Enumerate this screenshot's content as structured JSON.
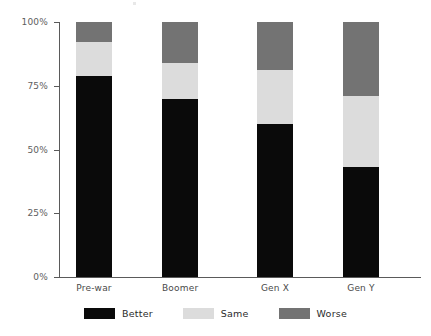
{
  "chart_data": {
    "type": "bar",
    "subtype": "stacked-percent",
    "title": "",
    "xlabel": "",
    "ylabel": "",
    "categories": [
      "Pre-war",
      "Boomer",
      "Gen X",
      "Gen Y"
    ],
    "series": [
      {
        "name": "Better",
        "color": "#0a0a0a",
        "values": [
          79,
          70,
          60,
          43
        ]
      },
      {
        "name": "Same",
        "color": "#dcdcdc",
        "values": [
          13,
          14,
          21,
          28
        ]
      },
      {
        "name": "Worse",
        "color": "#737373",
        "values": [
          8,
          16,
          19,
          29
        ]
      }
    ],
    "ylim": [
      0,
      100
    ],
    "yticks": [
      0,
      25,
      50,
      75,
      100
    ],
    "ytick_labels": [
      "0%",
      "25%",
      "50%",
      "75%",
      "100%"
    ],
    "grid": false,
    "legend_position": "bottom",
    "stack_order": [
      "Better",
      "Same",
      "Worse"
    ]
  },
  "axis": {
    "ticks": [
      {
        "label": "100%",
        "value": 100
      },
      {
        "label": "75%",
        "value": 75
      },
      {
        "label": "50%",
        "value": 50
      },
      {
        "label": "25%",
        "value": 25
      },
      {
        "label": "0%",
        "value": 0
      }
    ]
  },
  "categories": [
    {
      "label": "Pre-war"
    },
    {
      "label": "Boomer"
    },
    {
      "label": "Gen X"
    },
    {
      "label": "Gen Y"
    }
  ],
  "legend": {
    "items": [
      {
        "label": "Better",
        "color": "#0a0a0a"
      },
      {
        "label": "Same",
        "color": "#dcdcdc"
      },
      {
        "label": "Worse",
        "color": "#737373"
      }
    ]
  }
}
